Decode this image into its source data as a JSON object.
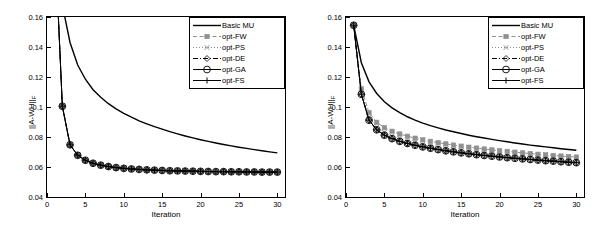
{
  "figure": {
    "panels": [
      {
        "name": "left-panel",
        "xlabel": "Iteration",
        "ylabel_main": "||A-WH||",
        "ylabel_sub": "F",
        "xticks": [
          0,
          5,
          10,
          15,
          20,
          25,
          30
        ],
        "yticks": [
          "0.04",
          "0.06",
          "0.08",
          "0.1",
          "0.12",
          "0.14",
          "0.16"
        ],
        "xlim": [
          0,
          31
        ],
        "ylim": [
          0.04,
          0.16
        ],
        "legend": [
          "Basic MU",
          "opt-FW",
          "opt-PS",
          "opt-DE",
          "opt-GA",
          "opt-FS"
        ]
      },
      {
        "name": "right-panel",
        "xlabel": "Iteration",
        "ylabel_main": "||A-WH||",
        "ylabel_sub": "F",
        "xticks": [
          0,
          5,
          10,
          15,
          20,
          25,
          30
        ],
        "yticks": [
          "0.04",
          "0.06",
          "0.08",
          "0.1",
          "0.12",
          "0.14",
          "0.16"
        ],
        "xlim": [
          0,
          31
        ],
        "ylim": [
          0.04,
          0.16
        ],
        "legend": [
          "Basic MU",
          "opt-FW",
          "opt-PS",
          "opt-DE",
          "opt-GA",
          "opt-FS"
        ]
      }
    ]
  },
  "chart_data": [
    {
      "type": "line",
      "title": "",
      "xlabel": "Iteration",
      "ylabel": "||A-WH||_F",
      "xlim": [
        0,
        31
      ],
      "ylim": [
        0.04,
        0.16
      ],
      "xticks": [
        0,
        5,
        10,
        15,
        20,
        25,
        30
      ],
      "yticks": [
        0.04,
        0.06,
        0.08,
        0.1,
        0.12,
        0.14,
        0.16
      ],
      "grid": false,
      "legend_position": "top-right",
      "x": [
        1,
        2,
        3,
        4,
        5,
        6,
        7,
        8,
        9,
        10,
        11,
        12,
        13,
        14,
        15,
        16,
        17,
        18,
        19,
        20,
        21,
        22,
        23,
        24,
        25,
        26,
        27,
        28,
        29,
        30
      ],
      "series": [
        {
          "name": "Basic MU",
          "style": "solid-line",
          "marker": "none",
          "color": "#000000",
          "values": [
            0.215,
            0.168,
            0.143,
            0.128,
            0.1185,
            0.1115,
            0.1065,
            0.1022,
            0.0988,
            0.0958,
            0.0932,
            0.0908,
            0.0888,
            0.0869,
            0.0852,
            0.0836,
            0.0821,
            0.0807,
            0.0794,
            0.0782,
            0.0771,
            0.076,
            0.075,
            0.0741,
            0.0732,
            0.0724,
            0.0716,
            0.0708,
            0.0701,
            0.0694
          ]
        },
        {
          "name": "opt-FW",
          "style": "dashed-line",
          "marker": "square",
          "color": "#909090",
          "values": [
            0.215,
            0.1005,
            0.0748,
            0.0678,
            0.0645,
            0.0625,
            0.0612,
            0.0603,
            0.0596,
            0.0591,
            0.0587,
            0.0584,
            0.0581,
            0.0579,
            0.0577,
            0.0575,
            0.0574,
            0.0573,
            0.0572,
            0.0571,
            0.057,
            0.0569,
            0.0569,
            0.0568,
            0.0568,
            0.0567,
            0.0567,
            0.0566,
            0.0566,
            0.0566
          ]
        },
        {
          "name": "opt-PS",
          "style": "dotted-line",
          "marker": "x",
          "color": "#8c8c8c",
          "values": [
            0.215,
            0.1005,
            0.0748,
            0.0678,
            0.0645,
            0.0625,
            0.0612,
            0.0603,
            0.0596,
            0.0591,
            0.0587,
            0.0584,
            0.0581,
            0.0579,
            0.0577,
            0.0575,
            0.0574,
            0.0573,
            0.0572,
            0.0571,
            0.057,
            0.0569,
            0.0569,
            0.0568,
            0.0568,
            0.0567,
            0.0567,
            0.0566,
            0.0566,
            0.0566
          ]
        },
        {
          "name": "opt-DE",
          "style": "dashdot-line",
          "marker": "diamond",
          "color": "#000000",
          "values": [
            0.215,
            0.1005,
            0.0748,
            0.0678,
            0.0645,
            0.0625,
            0.0612,
            0.0603,
            0.0596,
            0.0591,
            0.0587,
            0.0584,
            0.0581,
            0.0579,
            0.0577,
            0.0575,
            0.0574,
            0.0573,
            0.0572,
            0.0571,
            0.057,
            0.0569,
            0.0569,
            0.0568,
            0.0568,
            0.0567,
            0.0567,
            0.0566,
            0.0566,
            0.0566
          ]
        },
        {
          "name": "opt-GA",
          "style": "solid-line",
          "marker": "circle",
          "color": "#000000",
          "values": [
            0.215,
            0.1005,
            0.0748,
            0.0678,
            0.0645,
            0.0625,
            0.0612,
            0.0603,
            0.0596,
            0.0591,
            0.0587,
            0.0584,
            0.0581,
            0.0579,
            0.0577,
            0.0575,
            0.0574,
            0.0573,
            0.0572,
            0.0571,
            0.057,
            0.0569,
            0.0569,
            0.0568,
            0.0568,
            0.0567,
            0.0567,
            0.0566,
            0.0566,
            0.0566
          ]
        },
        {
          "name": "opt-FS",
          "style": "solid-line",
          "marker": "plus",
          "color": "#000000",
          "values": [
            0.215,
            0.1005,
            0.0748,
            0.0678,
            0.0645,
            0.0625,
            0.0612,
            0.0603,
            0.0596,
            0.0591,
            0.0587,
            0.0584,
            0.0581,
            0.0579,
            0.0577,
            0.0575,
            0.0574,
            0.0573,
            0.0572,
            0.0571,
            0.057,
            0.0569,
            0.0569,
            0.0568,
            0.0568,
            0.0567,
            0.0567,
            0.0566,
            0.0566,
            0.0566
          ]
        }
      ]
    },
    {
      "type": "line",
      "title": "",
      "xlabel": "Iteration",
      "ylabel": "||A-WH||_F",
      "xlim": [
        0,
        31
      ],
      "ylim": [
        0.04,
        0.16
      ],
      "xticks": [
        0,
        5,
        10,
        15,
        20,
        25,
        30
      ],
      "yticks": [
        0.04,
        0.06,
        0.08,
        0.1,
        0.12,
        0.14,
        0.16
      ],
      "grid": false,
      "legend_position": "top-right",
      "x": [
        1,
        2,
        3,
        4,
        5,
        6,
        7,
        8,
        9,
        10,
        11,
        12,
        13,
        14,
        15,
        16,
        17,
        18,
        19,
        20,
        21,
        22,
        23,
        24,
        25,
        26,
        27,
        28,
        29,
        30
      ],
      "series": [
        {
          "name": "Basic MU",
          "style": "solid-line",
          "marker": "none",
          "color": "#000000",
          "values": [
            0.1545,
            0.1295,
            0.1168,
            0.109,
            0.1035,
            0.0994,
            0.0962,
            0.0935,
            0.0913,
            0.0893,
            0.0876,
            0.0861,
            0.0847,
            0.0835,
            0.0823,
            0.0812,
            0.0802,
            0.0793,
            0.0784,
            0.0776,
            0.0768,
            0.076,
            0.0753,
            0.0746,
            0.074,
            0.0734,
            0.0728,
            0.0722,
            0.0717,
            0.0712
          ]
        },
        {
          "name": "opt-FW",
          "style": "dashed-line",
          "marker": "square",
          "color": "#909090",
          "values": [
            0.1545,
            0.1122,
            0.0962,
            0.0898,
            0.0862,
            0.0838,
            0.082,
            0.0805,
            0.0792,
            0.0781,
            0.0771,
            0.0762,
            0.0754,
            0.0746,
            0.0739,
            0.0732,
            0.0726,
            0.072,
            0.0714,
            0.0709,
            0.0704,
            0.0699,
            0.0694,
            0.069,
            0.0685,
            0.0681,
            0.0677,
            0.0673,
            0.067,
            0.0666
          ]
        },
        {
          "name": "opt-PS",
          "style": "dotted-line",
          "marker": "x",
          "color": "#8c8c8c",
          "values": [
            0.1545,
            0.1098,
            0.093,
            0.0865,
            0.083,
            0.0806,
            0.0788,
            0.0773,
            0.076,
            0.0749,
            0.0739,
            0.073,
            0.0722,
            0.0715,
            0.0708,
            0.0701,
            0.0695,
            0.0689,
            0.0684,
            0.0679,
            0.0674,
            0.0669,
            0.0665,
            0.0661,
            0.0657,
            0.0653,
            0.0649,
            0.0646,
            0.0642,
            0.0639
          ]
        },
        {
          "name": "opt-DE",
          "style": "dashdot-line",
          "marker": "diamond",
          "color": "#000000",
          "values": [
            0.1545,
            0.1085,
            0.0912,
            0.0848,
            0.0812,
            0.0789,
            0.0771,
            0.0757,
            0.0745,
            0.0734,
            0.0725,
            0.0716,
            0.0708,
            0.0701,
            0.0694,
            0.0688,
            0.0682,
            0.0677,
            0.0672,
            0.0667,
            0.0662,
            0.0658,
            0.0654,
            0.065,
            0.0646,
            0.0642,
            0.0639,
            0.0635,
            0.0632,
            0.0629
          ]
        },
        {
          "name": "opt-GA",
          "style": "solid-line",
          "marker": "circle",
          "color": "#000000",
          "values": [
            0.1545,
            0.1085,
            0.0912,
            0.0848,
            0.0812,
            0.0789,
            0.0771,
            0.0757,
            0.0745,
            0.0734,
            0.0725,
            0.0716,
            0.0708,
            0.0701,
            0.0694,
            0.0688,
            0.0682,
            0.0677,
            0.0672,
            0.0667,
            0.0662,
            0.0658,
            0.0654,
            0.065,
            0.0646,
            0.0642,
            0.0639,
            0.0635,
            0.0632,
            0.0629
          ]
        },
        {
          "name": "opt-FS",
          "style": "solid-line",
          "marker": "plus",
          "color": "#000000",
          "values": [
            0.1545,
            0.1085,
            0.0912,
            0.0848,
            0.0812,
            0.0789,
            0.0771,
            0.0757,
            0.0745,
            0.0734,
            0.0725,
            0.0716,
            0.0708,
            0.0701,
            0.0694,
            0.0688,
            0.0682,
            0.0677,
            0.0672,
            0.0667,
            0.0662,
            0.0658,
            0.0654,
            0.065,
            0.0646,
            0.0642,
            0.0639,
            0.0635,
            0.0632,
            0.0629
          ]
        }
      ]
    }
  ]
}
